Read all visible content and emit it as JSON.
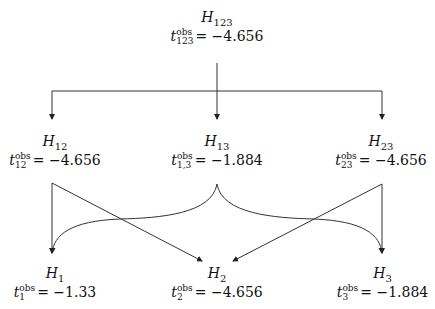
{
  "diagram": {
    "nodes": {
      "h123": {
        "label_main": "H",
        "label_sub": "123",
        "stat_sup": "obs",
        "stat_sub": "123",
        "stat_eq": "= −4.656"
      },
      "h12": {
        "label_main": "H",
        "label_sub": "12",
        "stat_sup": "obs",
        "stat_sub": "12",
        "stat_eq": "= −4.656"
      },
      "h13": {
        "label_main": "H",
        "label_sub": "13",
        "stat_sup": "obs",
        "stat_sub": "1,3",
        "stat_eq": "= −1.884"
      },
      "h23": {
        "label_main": "H",
        "label_sub": "23",
        "stat_sup": "obs",
        "stat_sub": "23",
        "stat_eq": "= −4.656"
      },
      "h1": {
        "label_main": "H",
        "label_sub": "1",
        "stat_sup": "obs",
        "stat_sub": "1",
        "stat_eq": "= −1.33"
      },
      "h2": {
        "label_main": "H",
        "label_sub": "2",
        "stat_sup": "obs",
        "stat_sub": "2",
        "stat_eq": "= −4.656"
      },
      "h3": {
        "label_main": "H",
        "label_sub": "3",
        "stat_sup": "obs",
        "stat_sub": "3",
        "stat_eq": "= −1.884"
      }
    },
    "edges": [
      {
        "from": "H123",
        "to": "H12"
      },
      {
        "from": "H123",
        "to": "H13"
      },
      {
        "from": "H123",
        "to": "H23"
      },
      {
        "from": "H12",
        "to": "H1"
      },
      {
        "from": "H12",
        "to": "H2"
      },
      {
        "from": "H13",
        "to": "H1"
      },
      {
        "from": "H13",
        "to": "H3"
      },
      {
        "from": "H23",
        "to": "H2"
      },
      {
        "from": "H23",
        "to": "H3"
      }
    ],
    "stat_symbol": "t",
    "line_color": "#333333"
  }
}
